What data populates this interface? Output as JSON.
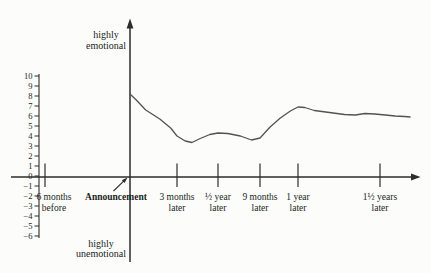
{
  "figure": {
    "y_label_top_lines": [
      "highly",
      "emotional"
    ],
    "y_label_bottom_lines": [
      "highly",
      "unemotional"
    ]
  },
  "chart_data": {
    "type": "line",
    "title": "",
    "ylim": [
      -6,
      10
    ],
    "y_ticks": [
      10,
      9,
      8,
      7,
      6,
      5,
      4,
      3,
      2,
      1,
      0,
      -1,
      -2,
      -3,
      -4,
      -5,
      -6
    ],
    "y_axis_top_label": "highly emotional",
    "y_axis_bottom_label": "highly unemotional",
    "x_ticks": [
      {
        "months": -6,
        "lines": [
          "6 months",
          "before"
        ],
        "bold": false,
        "dx": 9
      },
      {
        "months": 0,
        "lines": [
          "Announcement"
        ],
        "bold": true,
        "dx": -14
      },
      {
        "months": 3,
        "lines": [
          "3 months",
          "later"
        ],
        "bold": false,
        "dx": 0
      },
      {
        "months": 6,
        "lines": [
          "½ year",
          "later"
        ],
        "bold": false,
        "dx": 0
      },
      {
        "months": 9,
        "lines": [
          "9 months",
          "later"
        ],
        "bold": false,
        "dx": 0
      },
      {
        "months": 12,
        "lines": [
          "1 year",
          "later"
        ],
        "bold": false,
        "dx": 0
      },
      {
        "months": 18,
        "lines": [
          "1½ years",
          "later"
        ],
        "bold": false,
        "dx": 0
      }
    ],
    "series": [
      {
        "name": "emotional response over time",
        "points": [
          [
            0,
            8.2
          ],
          [
            0.4,
            7.6
          ],
          [
            1.0,
            6.6
          ],
          [
            1.9,
            5.7
          ],
          [
            2.6,
            4.8
          ],
          [
            3.0,
            4.0
          ],
          [
            3.6,
            3.5
          ],
          [
            4.1,
            3.35
          ],
          [
            4.7,
            3.75
          ],
          [
            5.4,
            4.15
          ],
          [
            6.0,
            4.3
          ],
          [
            6.7,
            4.25
          ],
          [
            7.6,
            4.0
          ],
          [
            8.4,
            3.6
          ],
          [
            9.0,
            3.8
          ],
          [
            9.8,
            4.9
          ],
          [
            10.6,
            5.8
          ],
          [
            11.4,
            6.5
          ],
          [
            12.0,
            6.9
          ],
          [
            12.5,
            6.85
          ],
          [
            13.2,
            6.55
          ],
          [
            14.3,
            6.35
          ],
          [
            15.4,
            6.15
          ],
          [
            16.2,
            6.1
          ],
          [
            16.9,
            6.25
          ],
          [
            17.6,
            6.2
          ],
          [
            18.4,
            6.1
          ],
          [
            19.1,
            6.0
          ],
          [
            19.8,
            5.95
          ],
          [
            20.2,
            5.9
          ]
        ]
      }
    ],
    "annotations": {
      "announcement_arrow": {
        "from": [
          113.5,
          191
        ],
        "to": [
          124.2,
          180.7
        ],
        "tip": [
          127.5,
          177.5
        ]
      }
    },
    "layout": {
      "background": "#fcfcfa",
      "axis_color": "#2e2c2a",
      "curve_color": "#56534f",
      "text_color": "#201e1c",
      "x_axis_y": 177,
      "x_axis_start": 11,
      "x_axis_end": 420.5,
      "y_axis_x": 130,
      "y_axis_top": 18.5,
      "y_axis_bottom": 262,
      "scale_x": 39,
      "scale_top_y": 74,
      "scale_bottom_y": 238,
      "zero_y": 176,
      "px_per_unit": 10,
      "scale_tick_len": 4.5,
      "x_tick_top": 163.5,
      "x_tick_bottom": 187,
      "xlabel_baseline1": 199.5,
      "xlabel_baseline2": 210.5,
      "month_anchors": [
        [
          -6,
          45
        ],
        [
          0,
          130
        ],
        [
          3,
          177
        ],
        [
          6,
          218
        ],
        [
          9,
          260
        ],
        [
          12,
          298
        ],
        [
          18,
          380
        ],
        [
          21,
          421
        ]
      ]
    }
  }
}
